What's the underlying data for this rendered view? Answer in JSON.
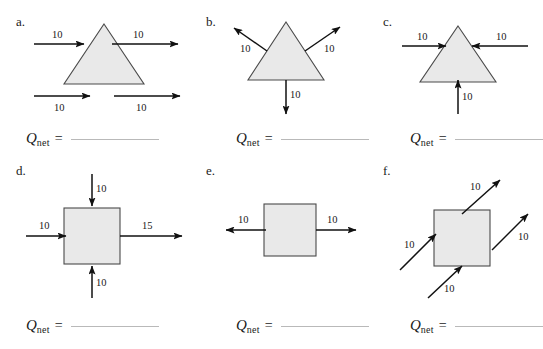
{
  "worksheet": {
    "background_color": "#ffffff",
    "shape_fill": "#e9e9e9",
    "shape_stroke": "#4a4a4a",
    "arrow_color": "#111111",
    "blank_line_color": "#b9b9b9"
  },
  "panels": [
    {
      "letter": "a.",
      "shape": "triangle",
      "qnet_symbol": "Q",
      "qnet_subscript": "net",
      "qnet_equals": "=",
      "arrows": [
        {
          "name": "arrow-left-in",
          "value": "10",
          "direction": "right",
          "position": "left-mid-into-triangle"
        },
        {
          "name": "arrow-right-out",
          "value": "10",
          "direction": "right",
          "position": "right-mid-out-of-triangle"
        },
        {
          "name": "arrow-below-left",
          "value": "10",
          "direction": "right",
          "position": "below-left"
        },
        {
          "name": "arrow-below-right",
          "value": "10",
          "direction": "right",
          "position": "below-right"
        }
      ]
    },
    {
      "letter": "b.",
      "shape": "triangle",
      "qnet_symbol": "Q",
      "qnet_subscript": "net",
      "qnet_equals": "=",
      "arrows": [
        {
          "name": "arrow-upper-left-out",
          "value": "10",
          "direction": "up-left",
          "position": "left-face-outward"
        },
        {
          "name": "arrow-upper-right-out",
          "value": "10",
          "direction": "up-right",
          "position": "right-face-outward"
        },
        {
          "name": "arrow-bottom-out",
          "value": "10",
          "direction": "down",
          "position": "base-outward"
        }
      ]
    },
    {
      "letter": "c.",
      "shape": "triangle",
      "qnet_symbol": "Q",
      "qnet_subscript": "net",
      "qnet_equals": "=",
      "arrows": [
        {
          "name": "arrow-left-in",
          "value": "10",
          "direction": "right",
          "position": "left-inward"
        },
        {
          "name": "arrow-right-in",
          "value": "10",
          "direction": "left",
          "position": "right-inward"
        },
        {
          "name": "arrow-bottom-in",
          "value": "10",
          "direction": "up",
          "position": "base-inward"
        }
      ]
    },
    {
      "letter": "d.",
      "shape": "square",
      "qnet_symbol": "Q",
      "qnet_subscript": "net",
      "qnet_equals": "=",
      "arrows": [
        {
          "name": "arrow-top-in",
          "value": "10",
          "direction": "down",
          "position": "top-inward"
        },
        {
          "name": "arrow-left-in",
          "value": "10",
          "direction": "right",
          "position": "left-inward"
        },
        {
          "name": "arrow-bottom-in",
          "value": "10",
          "direction": "up",
          "position": "bottom-inward"
        },
        {
          "name": "arrow-right-out",
          "value": "15",
          "direction": "right",
          "position": "right-outward"
        }
      ]
    },
    {
      "letter": "e.",
      "shape": "square",
      "qnet_symbol": "Q",
      "qnet_subscript": "net",
      "qnet_equals": "=",
      "arrows": [
        {
          "name": "arrow-left-out",
          "value": "10",
          "direction": "left",
          "position": "left-outward"
        },
        {
          "name": "arrow-right-out",
          "value": "10",
          "direction": "right",
          "position": "right-outward"
        }
      ]
    },
    {
      "letter": "f.",
      "shape": "square",
      "qnet_symbol": "Q",
      "qnet_subscript": "net",
      "qnet_equals": "=",
      "arrows": [
        {
          "name": "arrow-top-out",
          "value": "10",
          "direction": "up-right",
          "position": "top-outward"
        },
        {
          "name": "arrow-right-out",
          "value": "10",
          "direction": "up-right",
          "position": "right-outward"
        },
        {
          "name": "arrow-left-in",
          "value": "10",
          "direction": "up-right",
          "position": "left-inward"
        },
        {
          "name": "arrow-bottom-in",
          "value": "10",
          "direction": "up-right",
          "position": "bottom-inward"
        }
      ]
    }
  ]
}
